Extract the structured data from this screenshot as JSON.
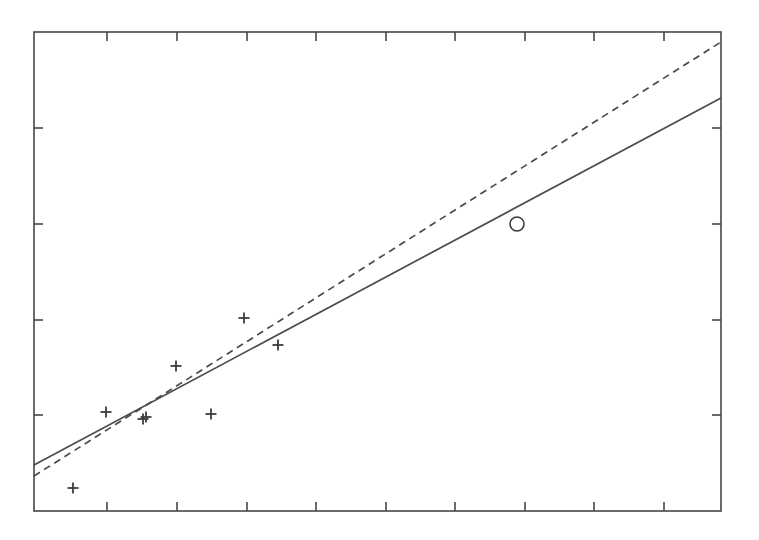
{
  "figure": {
    "width": 759,
    "height": 540,
    "background_color": "#ffffff",
    "axis_color": "#464646",
    "data_color": "#3c3c3c",
    "line_color": "#4b4b4b"
  },
  "chart_data": {
    "type": "scatter",
    "title": "",
    "subtitle": "",
    "xlabel": "",
    "ylabel": "",
    "xlim": [
      0,
      10
    ],
    "ylim": [
      0,
      5
    ],
    "grid": false,
    "legend": null,
    "legend_position": "none",
    "frame": {
      "style": "full-box",
      "tick_direction": "in",
      "tick_labels_shown": false,
      "x_tick_count": 9,
      "y_tick_count": 4,
      "x_tick_values": [
        1,
        2,
        3,
        4,
        5,
        6,
        7,
        8,
        9
      ],
      "y_tick_values": [
        1,
        2,
        3,
        4
      ]
    },
    "series": [
      {
        "name": "observations",
        "type": "scatter",
        "marker": "plus",
        "marker_size": 11,
        "points": [
          {
            "x": 0.57,
            "y": 0.24
          },
          {
            "x": 1.05,
            "y": 0.79
          },
          {
            "x": 1.59,
            "y": 0.72
          },
          {
            "x": 1.63,
            "y": 0.73
          },
          {
            "x": 2.07,
            "y": 1.25
          },
          {
            "x": 2.58,
            "y": 0.76
          },
          {
            "x": 3.06,
            "y": 1.76
          },
          {
            "x": 3.55,
            "y": 1.48
          }
        ],
        "pixel_points": [
          {
            "px": 73,
            "py": 488
          },
          {
            "px": 106,
            "py": 412
          },
          {
            "px": 143,
            "py": 419
          },
          {
            "px": 146,
            "py": 417
          },
          {
            "px": 176,
            "py": 366
          },
          {
            "px": 211,
            "py": 414
          },
          {
            "px": 244,
            "py": 318
          },
          {
            "px": 278,
            "py": 345
          }
        ]
      },
      {
        "name": "highlighted-observation",
        "type": "scatter",
        "marker": "circle-open",
        "marker_size": 14,
        "points": [
          {
            "x": 7.03,
            "y": 2.74
          }
        ],
        "pixel_points": [
          {
            "px": 517,
            "py": 224
          }
        ]
      },
      {
        "name": "fit-line-solid",
        "type": "line",
        "style": "solid",
        "endpoints": [
          {
            "x": 0.0,
            "y": 0.48
          },
          {
            "x": 10.0,
            "y": 4.31
          }
        ],
        "pixel_endpoints": [
          {
            "px": 34,
            "py": 465
          },
          {
            "px": 721,
            "py": 98
          }
        ]
      },
      {
        "name": "fit-line-dashed",
        "type": "line",
        "style": "dashed",
        "dash_pattern": "7 5",
        "endpoints": [
          {
            "x": 0.0,
            "y": 0.37
          },
          {
            "x": 10.0,
            "y": 4.89
          }
        ],
        "pixel_endpoints": [
          {
            "px": 34,
            "py": 476
          },
          {
            "px": 721,
            "py": 42
          }
        ]
      }
    ],
    "annotations": []
  },
  "geometry": {
    "plot_left": 34,
    "plot_right": 721,
    "plot_top": 32,
    "plot_bottom": 511,
    "tick_length": 9,
    "x_tick_pixels": [
      107,
      177,
      247,
      316,
      386,
      455,
      525,
      594,
      664
    ],
    "y_tick_pixels": [
      128,
      224,
      320,
      415
    ]
  }
}
